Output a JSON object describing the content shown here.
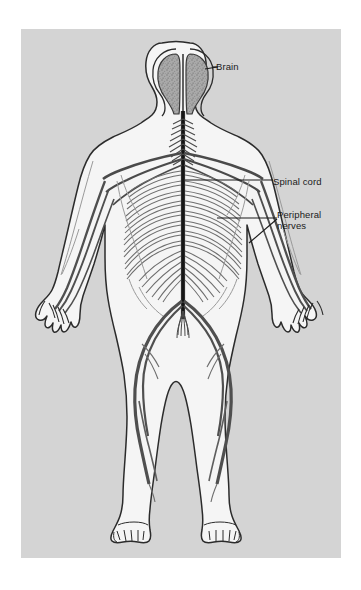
{
  "figure": {
    "panel_background_color": "#d4d4d4",
    "page_background_color": "#ffffff",
    "body_fill_color": "#f5f5f5",
    "outline_color": "#2b2b2b",
    "nerve_color": "#5a5a5a",
    "brain_fill_color": "#a8a8a8",
    "label_color": "#1a1a1a",
    "view": "posterior (back) view of full human body"
  },
  "labels": [
    {
      "id": "brain",
      "text": "Brain",
      "leader": "horizontal line from label left edge to the right cerebral hemisphere"
    },
    {
      "id": "spinal_cord",
      "text": "Spinal cord",
      "leader": "horizontal line from label left edge to the vertical spinal cord in the thorax"
    },
    {
      "id": "peripheral_nerves",
      "text": "Peripheral\nnerves",
      "line1": "Peripheral",
      "line2": "nerves",
      "leader": "forked line: horizontal branch to the thoracic intercostal nerves and diagonal branch down-left to the arm nerves"
    }
  ],
  "structures": [
    {
      "name": "brain",
      "description": "two cerebral hemispheres with stippled cortex texture inside the skull outline"
    },
    {
      "name": "cervical-spine",
      "description": "feathered herringbone nerve roots at the neck"
    },
    {
      "name": "spinal-cord",
      "description": "thick dark vertical cord running from the brainstem to the lumbar region"
    },
    {
      "name": "brachial-plexus",
      "description": "nerve fan spreading from the cervical spine to each shoulder"
    },
    {
      "name": "intercostal-nerves",
      "description": "stacked pairs of rib-following nerves across the thorax"
    },
    {
      "name": "arm-nerves",
      "description": "radial, median and ulnar nerve bundles running down each arm into the hand"
    },
    {
      "name": "lumbar-plexus",
      "description": "nerve branches spreading across the lower back"
    },
    {
      "name": "cauda-equina",
      "description": "tuft of nerve roots at the base of the spinal cord"
    },
    {
      "name": "sciatic-nerves",
      "description": "thick nerve trunks arcing from the pelvis down the back of each leg"
    },
    {
      "name": "tibial-nerves",
      "description": "nerve branches continuing down each lower leg to the ankle"
    }
  ]
}
